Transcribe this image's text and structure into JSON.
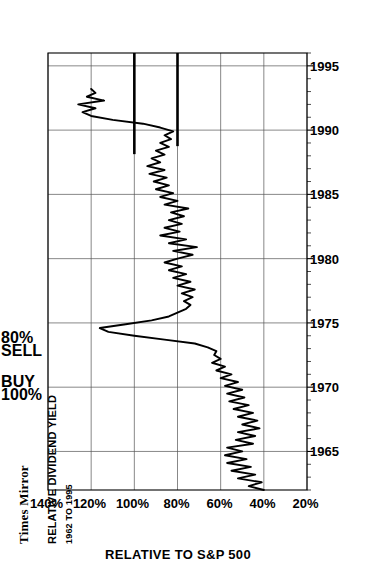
{
  "title": {
    "company": "Times Mirror",
    "metric": "RELATIVE DIVIDEND YIELD",
    "period": "1962 TO 1995"
  },
  "annotations": [
    {
      "name": "buy-marker",
      "line1": "BUY",
      "line2": "100%",
      "value": 100
    },
    {
      "name": "sell-marker",
      "line1": "80%",
      "line2": "SELL",
      "value": 80
    }
  ],
  "axes": {
    "value_axis_title": "RELATIVE TO S&P 500",
    "value_ticks": [
      "140%",
      "120%",
      "100%",
      "80%",
      "60%",
      "40%",
      "20%"
    ],
    "time_ticks": [
      "1965",
      "1970",
      "1975",
      "1980",
      "1985",
      "1990",
      "1995"
    ]
  },
  "chart_data": {
    "type": "line",
    "subtitle": "1962 TO 1995",
    "xlabel": "",
    "ylabel": "RELATIVE TO S&P 500",
    "xlim": [
      1962,
      1996
    ],
    "ylim": [
      20,
      140
    ],
    "ytick_values": [
      140,
      120,
      100,
      80,
      60,
      40,
      20
    ],
    "xtick_values": [
      1965,
      1970,
      1975,
      1980,
      1985,
      1990,
      1995
    ],
    "grid": true,
    "legend": "none",
    "units": "percent of S&P 500 dividend yield",
    "reference_lines": [
      {
        "label": "BUY 100%",
        "value": 100,
        "orientation": "value-axis"
      },
      {
        "label": "80% SELL",
        "value": 80,
        "orientation": "value-axis"
      }
    ],
    "x": [
      1962.0,
      1962.3,
      1962.6,
      1962.9,
      1963.2,
      1963.5,
      1963.8,
      1964.1,
      1964.4,
      1964.7,
      1965.0,
      1965.3,
      1965.6,
      1965.9,
      1966.2,
      1966.5,
      1966.8,
      1967.1,
      1967.4,
      1967.7,
      1968.0,
      1968.3,
      1968.6,
      1968.9,
      1969.2,
      1969.5,
      1969.8,
      1970.1,
      1970.4,
      1970.7,
      1971.0,
      1971.3,
      1971.6,
      1971.9,
      1972.2,
      1972.5,
      1972.8,
      1973.1,
      1973.4,
      1973.7,
      1974.0,
      1974.3,
      1974.6,
      1974.9,
      1975.2,
      1975.5,
      1975.8,
      1976.1,
      1976.4,
      1976.7,
      1977.0,
      1977.3,
      1977.6,
      1977.9,
      1978.2,
      1978.5,
      1978.8,
      1979.1,
      1979.4,
      1979.7,
      1980.0,
      1980.3,
      1980.6,
      1980.9,
      1981.2,
      1981.5,
      1981.8,
      1982.1,
      1982.4,
      1982.7,
      1983.0,
      1983.3,
      1983.6,
      1983.9,
      1984.2,
      1984.5,
      1984.8,
      1985.1,
      1985.4,
      1985.7,
      1986.0,
      1986.3,
      1986.6,
      1986.9,
      1987.2,
      1987.5,
      1987.8,
      1988.1,
      1988.4,
      1988.7,
      1989.0,
      1989.3,
      1989.6,
      1989.9,
      1990.2,
      1990.5,
      1990.8,
      1991.1,
      1991.4,
      1991.7,
      1992.0,
      1992.3,
      1992.6,
      1992.9,
      1993.2
    ],
    "values": [
      40,
      47,
      41,
      52,
      44,
      55,
      46,
      57,
      48,
      58,
      50,
      57,
      45,
      53,
      44,
      52,
      42,
      50,
      43,
      52,
      45,
      54,
      47,
      56,
      49,
      57,
      50,
      58,
      52,
      60,
      55,
      62,
      58,
      64,
      60,
      63,
      62,
      66,
      72,
      86,
      100,
      112,
      116,
      104,
      92,
      84,
      80,
      76,
      74,
      77,
      73,
      78,
      72,
      80,
      74,
      82,
      76,
      84,
      78,
      86,
      80,
      73,
      82,
      71,
      84,
      76,
      88,
      79,
      86,
      78,
      84,
      77,
      83,
      75,
      86,
      80,
      88,
      82,
      90,
      84,
      91,
      85,
      93,
      86,
      94,
      88,
      92,
      86,
      90,
      84,
      88,
      83,
      86,
      82,
      88,
      96,
      110,
      120,
      124,
      118,
      126,
      114,
      122,
      118,
      120
    ]
  }
}
